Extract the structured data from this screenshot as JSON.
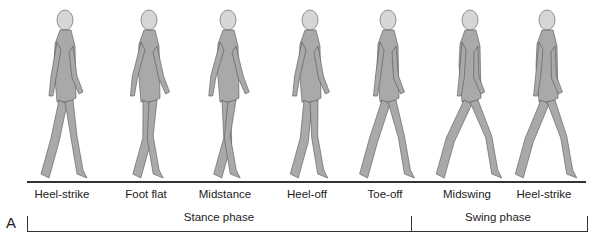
{
  "figure": {
    "panel_label": "A",
    "colors": {
      "body": "#a9a9a9",
      "head": "#d6d6d6",
      "outline": "#555555",
      "line": "#333333"
    },
    "events": [
      {
        "label": "Heel-strike",
        "x": 62
      },
      {
        "label": "Foot flat",
        "x": 146
      },
      {
        "label": "Midstance",
        "x": 225
      },
      {
        "label": "Heel-off",
        "x": 307
      },
      {
        "label": "Toe-off",
        "x": 385
      },
      {
        "label": "Midswing",
        "x": 467
      },
      {
        "label": "Heel-strike",
        "x": 544
      }
    ],
    "phases": [
      {
        "label": "Stance phase",
        "x_start": 27,
        "x_end": 411
      },
      {
        "label": "Swing phase",
        "x_start": 411,
        "x_end": 586
      }
    ]
  }
}
